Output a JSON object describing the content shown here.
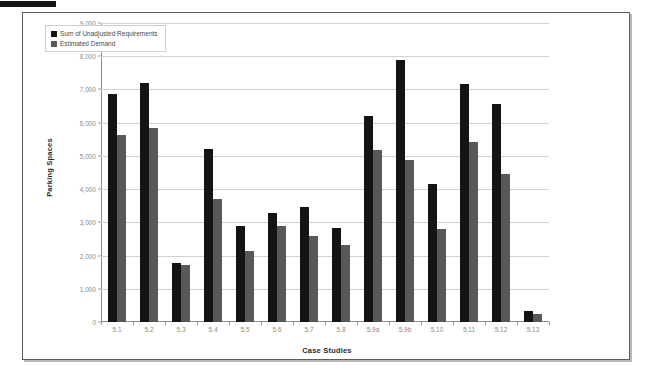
{
  "figure": {
    "edge_mark": "page-edge-bar"
  },
  "chart_data": {
    "type": "bar",
    "title": "",
    "subtitle": "",
    "xlabel": "Case Studies",
    "ylabel": "Parking Spaces",
    "categories": [
      "5.1",
      "5.2",
      "5.3",
      "5.4",
      "5.5",
      "5.6",
      "5.7",
      "5.8",
      "5.9a",
      "5.9b",
      "5.10",
      "5.11",
      "5.12",
      "5.13"
    ],
    "series": [
      {
        "name": "Sum of Unadjusted Requirements",
        "color": "#141414",
        "values": [
          6850,
          7180,
          1780,
          5210,
          2880,
          3280,
          3470,
          2840,
          6200,
          7880,
          4150,
          7170,
          6570,
          330
        ]
      },
      {
        "name": "Estimated Demand",
        "color": "#585858",
        "values": [
          5620,
          5830,
          1730,
          3700,
          2150,
          2890,
          2600,
          2330,
          5170,
          4870,
          2800,
          5420,
          4450,
          250
        ]
      }
    ],
    "ylim": [
      0,
      9000
    ],
    "ytick_values": [
      0,
      1000,
      2000,
      3000,
      4000,
      5000,
      6000,
      7000,
      8000,
      9000
    ],
    "ytick_labels": [
      "0",
      "1,000",
      "2,000",
      "3,000",
      "4,000",
      "5,000",
      "6,000",
      "7,000",
      "8,000",
      "9,000"
    ],
    "grid": true,
    "legend_position": "top-left",
    "bar_orientation": "vertical"
  },
  "legend": {
    "items": [
      {
        "label": "Sum of Unadjusted Requirements"
      },
      {
        "label": "Estimated Demand"
      }
    ]
  }
}
